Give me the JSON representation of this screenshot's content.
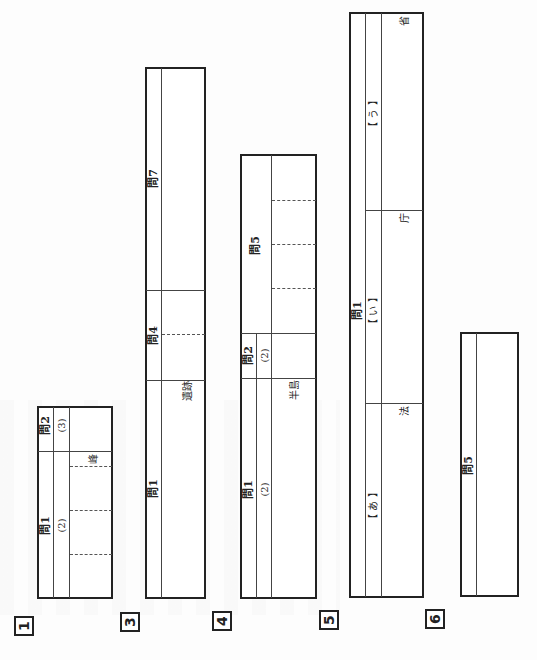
{
  "sections": [
    {
      "number": "1",
      "labels": {
        "q1": "問1",
        "q1_sub": "(2)",
        "q2": "問2",
        "q2_sub": "(3)",
        "suffix": "峰"
      }
    },
    {
      "number": "3",
      "labels": {
        "q1": "問1",
        "q1_suffix": "遺跡",
        "q4": "問4",
        "q7": "問7"
      }
    },
    {
      "number": "4",
      "labels": {
        "q1": "問1",
        "q1_sub": "(2)",
        "q1_suffix": "半島",
        "q2": "問2",
        "q2_sub": "(2)",
        "q5": "問5"
      }
    },
    {
      "number": "5",
      "labels": {
        "q1": "問1",
        "a": "【 あ 】",
        "a_suffix": "法",
        "i": "【 い 】",
        "i_suffix": "庁",
        "u": "【 う 】",
        "u_suffix": "省"
      }
    },
    {
      "number": "6",
      "labels": {
        "q5": "問5"
      }
    }
  ]
}
